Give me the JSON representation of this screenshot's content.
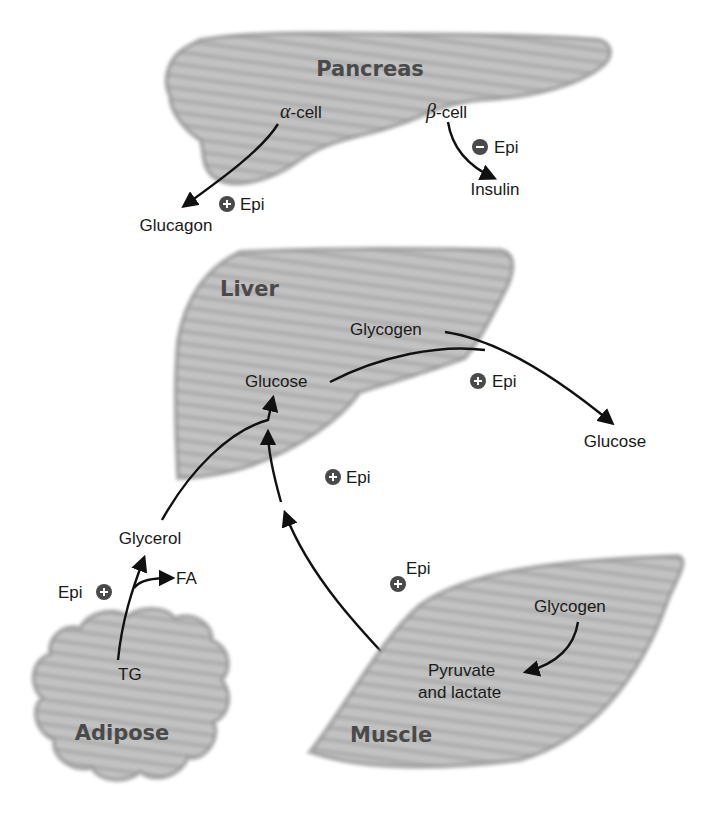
{
  "organs": {
    "pancreas": {
      "title": "Pancreas",
      "alpha_greek": "α",
      "alpha_suffix": "-cell",
      "beta_greek": "β",
      "beta_suffix": "-cell",
      "glucagon": "Glucagon",
      "insulin": "Insulin"
    },
    "liver": {
      "title": "Liver",
      "glycogen": "Glycogen",
      "glucose": "Glucose",
      "glucose_out": "Glucose"
    },
    "adipose": {
      "title": "Adipose",
      "tg": "TG",
      "fa": "FA",
      "glycerol": "Glycerol"
    },
    "muscle": {
      "title": "Muscle",
      "glycogen": "Glycogen",
      "pyruvate_line1": "Pyruvate",
      "pyruvate_line2": "and lactate"
    }
  },
  "regulators": [
    {
      "label": "Epi",
      "sign": "+",
      "target": "alpha-cell to glucagon"
    },
    {
      "label": "Epi",
      "sign": "−",
      "target": "beta-cell to insulin"
    },
    {
      "label": "Epi",
      "sign": "+",
      "target": "liver glycogenolysis"
    },
    {
      "label": "Epi",
      "sign": "+",
      "target": "gluconeogenesis"
    },
    {
      "label": "Epi",
      "sign": "+",
      "target": "adipose lipolysis"
    },
    {
      "label": "Epi",
      "sign": "+",
      "target": "muscle glycogenolysis"
    }
  ],
  "colors": {
    "organ_fill": "#bdbdbd",
    "organ_stripe": "#a9a9a9",
    "title_text": "#4a4a4a",
    "badge": "#4a4a4a",
    "arrow": "#111111"
  }
}
